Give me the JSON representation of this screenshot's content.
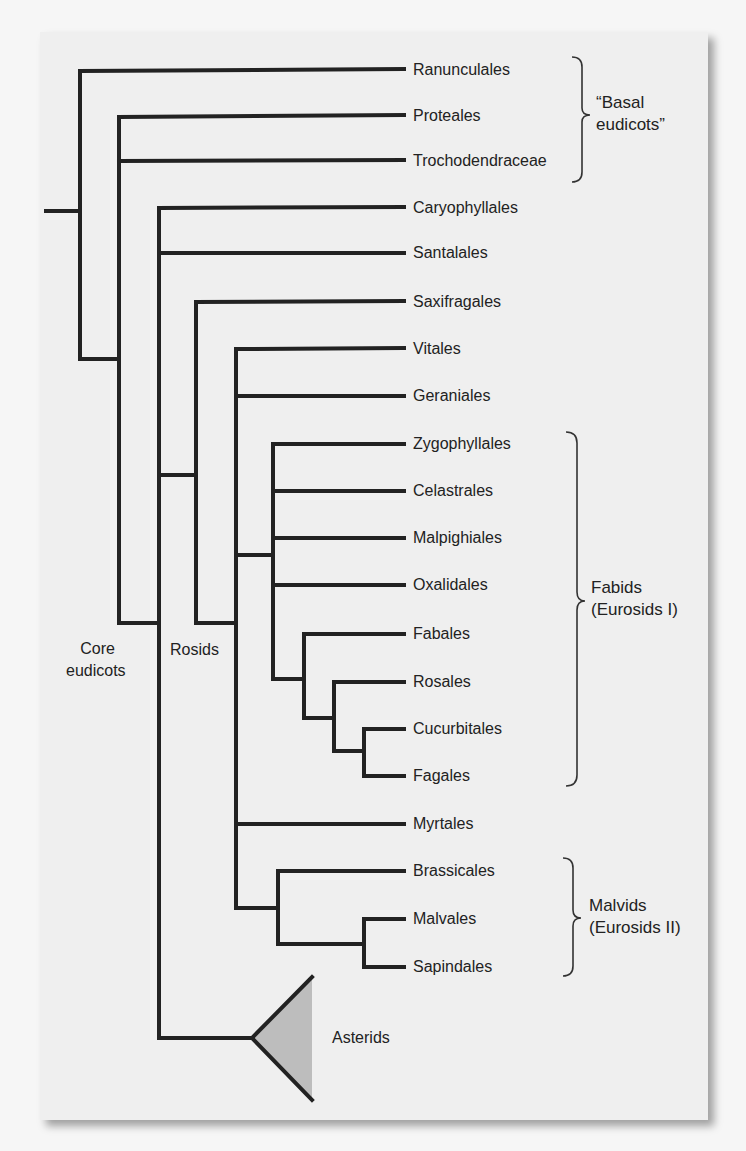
{
  "diagram": {
    "type": "phylogenetic-tree",
    "taxa": [
      {
        "label": "Ranunculales",
        "y": 70
      },
      {
        "label": "Proteales",
        "y": 116
      },
      {
        "label": "Trochodendraceae",
        "y": 161
      },
      {
        "label": "Caryophyllales",
        "y": 208
      },
      {
        "label": "Santalales",
        "y": 253
      },
      {
        "label": "Saxifragales",
        "y": 302
      },
      {
        "label": "Vitales",
        "y": 349
      },
      {
        "label": "Geraniales",
        "y": 396
      },
      {
        "label": "Zygophyllales",
        "y": 444
      },
      {
        "label": "Celastrales",
        "y": 491
      },
      {
        "label": "Malpighiales",
        "y": 538
      },
      {
        "label": "Oxalidales",
        "y": 585
      },
      {
        "label": "Fabales",
        "y": 634
      },
      {
        "label": "Rosales",
        "y": 682
      },
      {
        "label": "Cucurbitales",
        "y": 729
      },
      {
        "label": "Fagales",
        "y": 776
      },
      {
        "label": "Myrtales",
        "y": 824
      },
      {
        "label": "Brassicales",
        "y": 871
      },
      {
        "label": "Malvales",
        "y": 919
      },
      {
        "label": "Sapindales",
        "y": 967
      }
    ],
    "groups": [
      {
        "line1": "“Basal",
        "line2": "eudicots”",
        "members": [
          "Ranunculales",
          "Proteales",
          "Trochodendraceae"
        ]
      },
      {
        "line1": "Fabids",
        "line2": "(Eurosids I)",
        "members": [
          "Zygophyllales",
          "Celastrales",
          "Malpighiales",
          "Oxalidales",
          "Fabales",
          "Rosales",
          "Cucurbitales",
          "Fagales"
        ]
      },
      {
        "line1": "Malvids",
        "line2": "(Eurosids II)",
        "members": [
          "Brassicales",
          "Malvales",
          "Sapindales"
        ]
      }
    ],
    "node_labels": {
      "core_line1": "Core",
      "core_line2": "eudicots",
      "rosids": "Rosids"
    },
    "collapsed_clade": {
      "label": "Asterids"
    },
    "colors": {
      "line": "#222222",
      "panel": "#efefef",
      "triangle_fill": "#bdbdbd"
    }
  }
}
